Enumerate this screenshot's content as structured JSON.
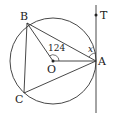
{
  "diagram": {
    "points": {
      "A": {
        "label": "A",
        "x": 96,
        "y": 61
      },
      "B": {
        "label": "B",
        "x": 27,
        "y": 23
      },
      "C": {
        "label": "C",
        "x": 24,
        "y": 93
      },
      "O": {
        "label": "O",
        "x": 53,
        "y": 61
      },
      "T": {
        "label": "T",
        "x": 96,
        "y": 15
      }
    },
    "circle": {
      "cx": 53,
      "cy": 61,
      "r": 43
    },
    "angle_label": "124",
    "unknown_label": "x",
    "colors": {
      "stroke": "#333333",
      "background": "#ffffff"
    }
  }
}
